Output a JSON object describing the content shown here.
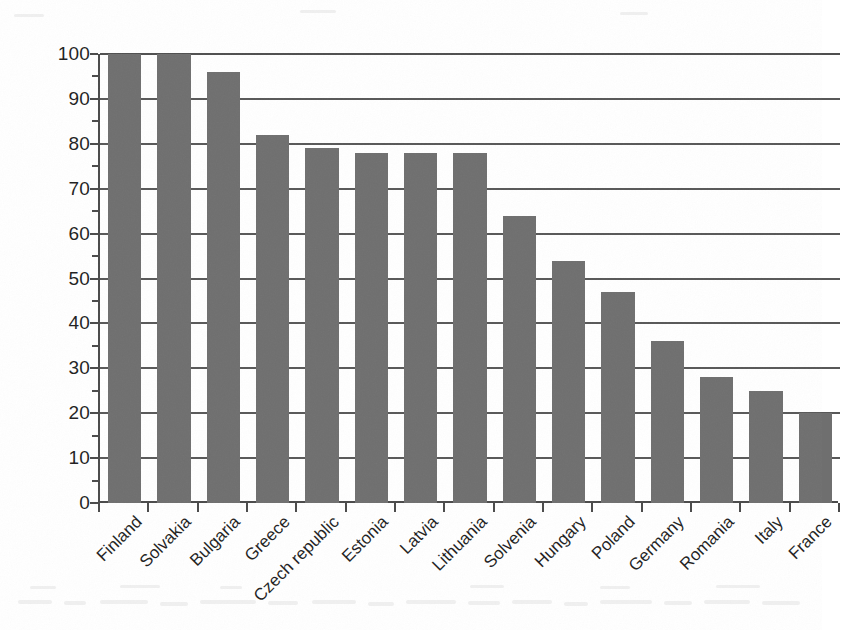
{
  "chart_data": {
    "type": "bar",
    "title": "",
    "subtitle": "",
    "xlabel": "",
    "ylabel": "",
    "ylim": [
      0,
      100
    ],
    "ytick_step": 10,
    "yticks": [
      0,
      10,
      20,
      30,
      40,
      50,
      60,
      70,
      80,
      90,
      100
    ],
    "ytick_labels": [
      "0",
      "10",
      "20",
      "30",
      "40",
      "50",
      "60",
      "70",
      "80",
      "90",
      "100"
    ],
    "grid": true,
    "grid_axis": "y",
    "legend": false,
    "legend_position": "none",
    "bar_color": "#6f6f6f",
    "axis_color": "#4a4a4a",
    "gridline_color": "#585858",
    "background_color": "#ffffff",
    "xtick_label_rotation": -45,
    "categories": [
      "Finland",
      "Solvakia",
      "Bulgaria",
      "Greece",
      "Czech republic",
      "Estonia",
      "Latvia",
      "Lithuania",
      "Solvenia",
      "Hungary",
      "Poland",
      "Germany",
      "Romania",
      "Italy",
      "France"
    ],
    "values": [
      100,
      100,
      96,
      82,
      79,
      78,
      78,
      78,
      64,
      54,
      47,
      36,
      28,
      25,
      20
    ],
    "series": [
      {
        "name": "",
        "values": [
          100,
          100,
          96,
          82,
          79,
          78,
          78,
          78,
          64,
          54,
          47,
          36,
          28,
          25,
          20
        ]
      }
    ]
  },
  "figure": {
    "caption": "",
    "note": ""
  }
}
